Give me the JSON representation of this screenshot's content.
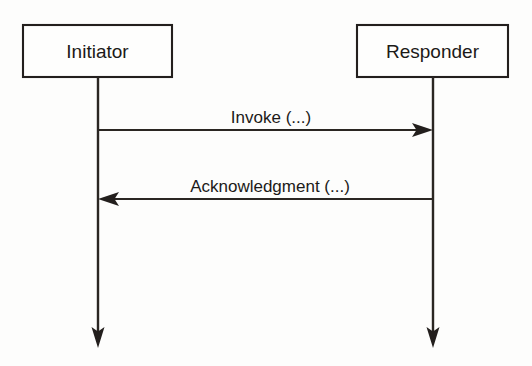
{
  "diagram": {
    "type": "uml-sequence-diagram",
    "title": "",
    "background_color": "#fdfdfc",
    "ink_color": "#231f1d",
    "participants": [
      {
        "id": "initiator",
        "label": "Initiator",
        "box": {
          "x": 23,
          "y": 25,
          "width": 149,
          "height": 52
        },
        "lifeline_x": 98,
        "lifeline_top": 77,
        "lifeline_bottom": 345,
        "lifeline_end_marker": "arrowhead-down"
      },
      {
        "id": "responder",
        "label": "Responder",
        "box": {
          "x": 357,
          "y": 25,
          "width": 151,
          "height": 52
        },
        "lifeline_x": 433,
        "lifeline_top": 77,
        "lifeline_bottom": 345,
        "lifeline_end_marker": "arrowhead-down"
      }
    ],
    "messages": [
      {
        "id": "invoke",
        "label": "Invoke (...)",
        "from": "initiator",
        "to": "responder",
        "direction": "left-to-right",
        "y": 130,
        "label_x": 271,
        "label_y": 123,
        "arrowhead": "solid-filled"
      },
      {
        "id": "acknowledgment",
        "label": "Acknowledgment (...)",
        "from": "responder",
        "to": "initiator",
        "direction": "right-to-left",
        "y": 199,
        "label_x": 270,
        "label_y": 192,
        "arrowhead": "solid-filled"
      }
    ]
  }
}
